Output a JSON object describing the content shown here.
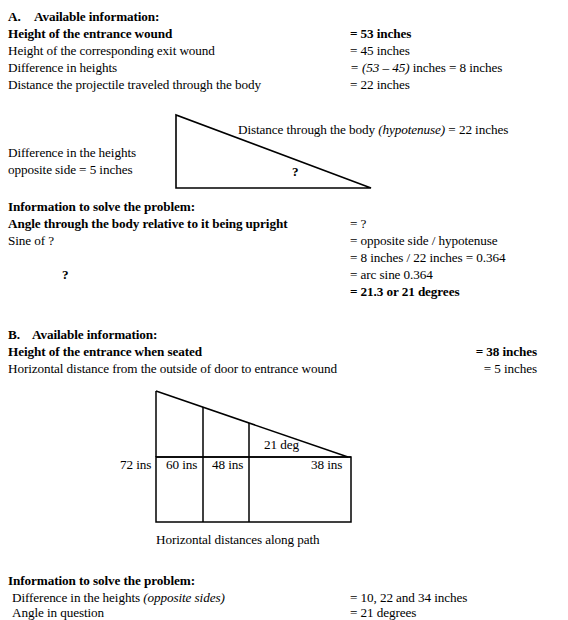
{
  "document": {
    "title": "Trajectory angle worked examples"
  },
  "section_a": {
    "label": "A.",
    "heading": "Available information:",
    "rows": [
      {
        "left": "Height of the entrance wound",
        "right": "= 53 inches",
        "bold": true
      },
      {
        "left": "Height of the corresponding exit wound",
        "right": "= 45 inches",
        "bold": false
      },
      {
        "left": "Difference in heights",
        "right_italic": "= (53 – 45)",
        "right_rest": " inches = 8 inches",
        "bold": false
      },
      {
        "left": "Distance the projectile traveled through the body",
        "right": "= 22 inches",
        "bold": false
      }
    ],
    "diagram": {
      "name": "right-triangle-through-body",
      "opposite_label_line1": "Difference in the heights",
      "opposite_label_line2": "opposite side = 5 inches",
      "hypotenuse_label_pre": "Distance through the body ",
      "hypotenuse_label_italic": "(hypotenuse)",
      "hypotenuse_label_post": " = 22 inches",
      "angle_marker": "?",
      "geometry": {
        "apex_x": 176,
        "apex_y": 115,
        "bottom_left_x": 176,
        "bottom_left_y": 188,
        "bottom_right_x": 371,
        "bottom_right_y": 188
      }
    },
    "solve": {
      "heading": "Information to solve the problem:",
      "rows": [
        {
          "left": "Angle through the body relative to it being upright",
          "left_bold": true,
          "right": "= ?"
        },
        {
          "left": "Sine of  ?",
          "left_bold": false,
          "right": "= opposite side / hypotenuse"
        },
        {
          "left": "",
          "left_bold": false,
          "right": "= 8 inches / 22 inches = 0.364"
        },
        {
          "left": "?",
          "left_bold": true,
          "right": "= arc sine 0.364"
        },
        {
          "left": "",
          "left_bold": false,
          "right": "= 21.3 or 21 degrees",
          "right_bold": true
        }
      ]
    }
  },
  "section_b": {
    "label": "B.",
    "heading": "Available information:",
    "rows": [
      {
        "left": "Height of the entrance when seated",
        "right": "= 38 inches",
        "bold": true
      },
      {
        "left": "Horizontal distance from the outside of door to entrance wound",
        "right": "= 5 inches",
        "bold": false
      }
    ],
    "diagram": {
      "name": "stepped-path-triangle",
      "caption": "Horizontal distances along path",
      "angle_label": "21 deg",
      "height_labels": [
        "72 ins",
        "60 ins",
        "48 ins",
        "38 ins"
      ],
      "geometry": {
        "apex_x": 156,
        "apex_y": 391,
        "base_y": 457,
        "box_bottom_y": 522,
        "right_x": 351,
        "dividers_x": [
          156,
          203,
          249,
          348
        ]
      }
    },
    "solve": {
      "heading": "Information to solve the problem:",
      "rows": [
        {
          "left_pre": "Difference in the heights ",
          "left_italic": "(opposite sides)",
          "right": "= 10, 22 and 34 inches"
        },
        {
          "left_pre": "Angle in question",
          "left_italic": "",
          "right": "= 21 degrees"
        }
      ]
    }
  },
  "style": {
    "ink": "#000000",
    "paper": "#ffffff"
  }
}
